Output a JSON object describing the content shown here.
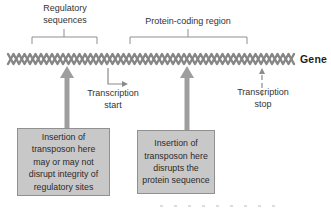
{
  "colors": {
    "background": "#ffffff",
    "helix": "#868686",
    "thick_arrow": "#9e9e9e",
    "thin_line": "#8a8a8a",
    "bracket": "#8f8f8f",
    "box_fill": "#c8c8c8",
    "box_border": "#909090",
    "text": "#333333",
    "gene_text": "#1f1f1f"
  },
  "labels": {
    "regulatory": "Regulatory\nsequences",
    "protein_region": "Protein-coding region",
    "gene": "Gene",
    "transcription_start": "Transcription\nstart",
    "transcription_stop": "Transcription\nstop"
  },
  "boxes": {
    "left": "Insertion of\ntransposon here\nmay or may not\ndisrupt integrity of\nregulatory sites",
    "right": "Insertion of\ntransposon here\ndisrupts the\nprotein sequence"
  }
}
